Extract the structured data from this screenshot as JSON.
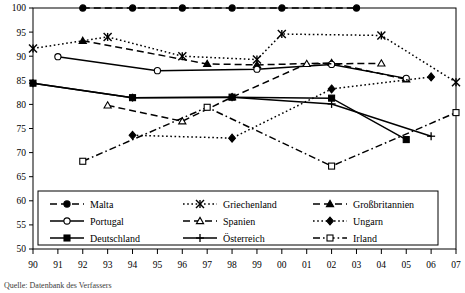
{
  "source_note": "Quelle: Datenbank des Verfassers",
  "legend": {
    "items": [
      {
        "label": "Malta",
        "marker": "filled-circle",
        "dash": "dashed"
      },
      {
        "label": "Griechenland",
        "marker": "cross-star",
        "dash": "dotted"
      },
      {
        "label": "Großbritannien",
        "marker": "filled-triangle",
        "dash": "dashed"
      },
      {
        "label": "Portugal",
        "marker": "open-circle",
        "dash": "solid"
      },
      {
        "label": "Spanien",
        "marker": "open-triangle",
        "dash": "dashed"
      },
      {
        "label": "Ungarn",
        "marker": "filled-diamond",
        "dash": "dotted"
      },
      {
        "label": "Deutschland",
        "marker": "filled-square",
        "dash": "solid"
      },
      {
        "label": "Österreich",
        "marker": "plus",
        "dash": "solid"
      },
      {
        "label": "Irland",
        "marker": "open-square",
        "dash": "dash-dot"
      }
    ]
  },
  "chart_data": {
    "type": "line",
    "title": "",
    "xlabel": "",
    "ylabel": "",
    "x": [
      "90",
      "91",
      "92",
      "93",
      "94",
      "95",
      "96",
      "97",
      "98",
      "99",
      "00",
      "01",
      "02",
      "03",
      "04",
      "05",
      "06",
      "07"
    ],
    "ylim": [
      50,
      100
    ],
    "yticks": [
      50,
      55,
      60,
      65,
      70,
      75,
      80,
      85,
      90,
      95,
      100
    ],
    "grid": false,
    "legend_position": "bottom",
    "series": [
      {
        "name": "Malta",
        "marker": "filled-circle",
        "dash": "dashed",
        "points": [
          {
            "x": "92",
            "y": 100
          },
          {
            "x": "94",
            "y": 100
          },
          {
            "x": "96",
            "y": 100
          },
          {
            "x": "98",
            "y": 100
          },
          {
            "x": "00",
            "y": 100
          },
          {
            "x": "03",
            "y": 100
          }
        ]
      },
      {
        "name": "Griechenland",
        "marker": "cross-star",
        "dash": "dotted",
        "points": [
          {
            "x": "90",
            "y": 91.6
          },
          {
            "x": "93",
            "y": 94.0
          },
          {
            "x": "96",
            "y": 90.0
          },
          {
            "x": "99",
            "y": 89.3
          },
          {
            "x": "00",
            "y": 94.6
          },
          {
            "x": "04",
            "y": 94.3
          },
          {
            "x": "07",
            "y": 84.6
          }
        ]
      },
      {
        "name": "Großbritannien",
        "marker": "filled-triangle",
        "dash": "dashed",
        "points": [
          {
            "x": "92",
            "y": 93.2
          },
          {
            "x": "97",
            "y": 88.4
          },
          {
            "x": "99",
            "y": 88.2
          },
          {
            "x": "02",
            "y": 88.6
          },
          {
            "x": "05",
            "y": 85.2
          }
        ]
      },
      {
        "name": "Portugal",
        "marker": "open-circle",
        "dash": "solid",
        "points": [
          {
            "x": "91",
            "y": 89.9
          },
          {
            "x": "95",
            "y": 87.0
          },
          {
            "x": "99",
            "y": 87.3
          },
          {
            "x": "02",
            "y": 88.3
          },
          {
            "x": "05",
            "y": 85.4
          }
        ]
      },
      {
        "name": "Spanien",
        "marker": "open-triangle",
        "dash": "dashed",
        "points": [
          {
            "x": "93",
            "y": 79.8
          },
          {
            "x": "96",
            "y": 76.5
          },
          {
            "x": "98",
            "y": 81.5
          },
          {
            "x": "01",
            "y": 88.4
          },
          {
            "x": "04",
            "y": 88.5
          }
        ]
      },
      {
        "name": "Ungarn",
        "marker": "filled-diamond",
        "dash": "dotted",
        "points": [
          {
            "x": "94",
            "y": 73.6
          },
          {
            "x": "98",
            "y": 73.0
          },
          {
            "x": "02",
            "y": 83.2
          },
          {
            "x": "06",
            "y": 85.7
          }
        ]
      },
      {
        "name": "Deutschland",
        "marker": "filled-square",
        "dash": "solid",
        "points": [
          {
            "x": "90",
            "y": 84.4
          },
          {
            "x": "94",
            "y": 81.4
          },
          {
            "x": "98",
            "y": 81.5
          },
          {
            "x": "02",
            "y": 81.3
          },
          {
            "x": "05",
            "y": 72.7
          }
        ]
      },
      {
        "name": "Österreich",
        "marker": "plus",
        "dash": "solid",
        "points": [
          {
            "x": "90",
            "y": 84.4
          },
          {
            "x": "94",
            "y": 81.4
          },
          {
            "x": "98",
            "y": 81.5
          },
          {
            "x": "02",
            "y": 80.1
          },
          {
            "x": "06",
            "y": 73.4
          }
        ]
      },
      {
        "name": "Irland",
        "marker": "open-square",
        "dash": "dash-dot",
        "points": [
          {
            "x": "92",
            "y": 68.2
          },
          {
            "x": "97",
            "y": 79.4
          },
          {
            "x": "02",
            "y": 67.2
          },
          {
            "x": "07",
            "y": 78.3
          }
        ]
      }
    ]
  }
}
